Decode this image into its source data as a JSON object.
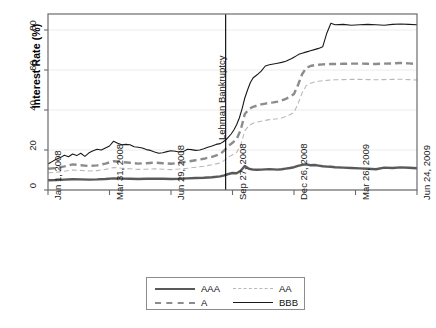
{
  "chart_data": {
    "type": "line",
    "title": "",
    "xlabel": "",
    "ylabel": "Interest Rate (%)",
    "ylim": [
      0,
      88
    ],
    "yticks": [
      0,
      20,
      40,
      60,
      80
    ],
    "ytick_labels": [
      "0",
      "20",
      "40",
      "60",
      "80"
    ],
    "xlim": [
      0,
      540
    ],
    "xticks": [
      0,
      90,
      180,
      270,
      360,
      450,
      540
    ],
    "xtick_labels": [
      "Jan 1, 2008",
      "Mar 31, 2008",
      "Jun 29, 2008",
      "Sep 27, 2008",
      "Dec 26, 2008",
      "Mar 26, 2009",
      "Jun 24, 2009"
    ],
    "grid": "horizontal",
    "legend_position": "below-center",
    "annotations": [
      {
        "text": "Lehman Bankruptcy",
        "x": 260,
        "orientation": "vertical",
        "line": "solid-black"
      }
    ],
    "series": [
      {
        "name": "AAA",
        "style": "solid",
        "width": "thick",
        "color": "#595959",
        "x": [
          0,
          12,
          24,
          36,
          48,
          60,
          72,
          84,
          96,
          108,
          120,
          132,
          144,
          156,
          168,
          180,
          192,
          204,
          216,
          228,
          240,
          252,
          258,
          264,
          270,
          276,
          282,
          288,
          294,
          300,
          306,
          312,
          318,
          324,
          330,
          336,
          342,
          348,
          354,
          360,
          366,
          372,
          378,
          384,
          390,
          396,
          402,
          408,
          414,
          420,
          432,
          444,
          456,
          468,
          480,
          492,
          504,
          516,
          528,
          540
        ],
        "y": [
          4.9,
          5.0,
          5.2,
          5.4,
          5.3,
          5.2,
          5.3,
          5.5,
          5.8,
          5.7,
          5.6,
          5.5,
          5.6,
          5.7,
          5.6,
          5.5,
          5.6,
          5.8,
          6.0,
          6.1,
          6.4,
          6.8,
          7.3,
          8.0,
          8.5,
          8.4,
          9.6,
          12.0,
          10.6,
          10.2,
          10.1,
          10.2,
          10.3,
          10.4,
          10.3,
          10.2,
          10.4,
          10.7,
          11.0,
          11.4,
          12.1,
          12.6,
          12.8,
          12.4,
          12.5,
          12.2,
          11.9,
          11.7,
          11.6,
          11.4,
          11.2,
          11.0,
          10.8,
          10.6,
          10.4,
          11.2,
          11.0,
          11.3,
          11.1,
          10.9
        ]
      },
      {
        "name": "AA",
        "style": "dashed",
        "width": "thin",
        "color": "#b8b8b8",
        "x": [
          0,
          12,
          24,
          36,
          48,
          60,
          72,
          84,
          96,
          108,
          120,
          132,
          144,
          156,
          168,
          180,
          192,
          204,
          216,
          228,
          240,
          252,
          258,
          264,
          270,
          276,
          282,
          288,
          294,
          300,
          306,
          312,
          318,
          324,
          330,
          336,
          342,
          348,
          354,
          360,
          366,
          372,
          378,
          384,
          390,
          396,
          402,
          408,
          414,
          420,
          432,
          444,
          456,
          468,
          480,
          492,
          504,
          516,
          528,
          540
        ],
        "y": [
          8.6,
          8.9,
          9.4,
          10.0,
          9.8,
          9.5,
          9.7,
          10.3,
          11.2,
          10.9,
          10.6,
          10.3,
          10.4,
          10.6,
          10.4,
          10.2,
          10.5,
          10.9,
          11.4,
          11.9,
          12.6,
          13.5,
          14.8,
          16.4,
          17.6,
          18.8,
          22.4,
          29.6,
          32.2,
          33.4,
          34.0,
          34.4,
          34.8,
          35.2,
          35.4,
          35.6,
          36.0,
          36.8,
          37.6,
          38.8,
          43.2,
          48.6,
          52.2,
          53.4,
          54.0,
          54.4,
          54.6,
          54.8,
          55.0,
          55.1,
          55.2,
          55.3,
          55.3,
          55.2,
          55.1,
          55.2,
          55.3,
          55.4,
          55.2,
          55.0
        ]
      },
      {
        "name": "A",
        "style": "dashed",
        "width": "thick",
        "color": "#8c8c8c",
        "x": [
          0,
          12,
          24,
          36,
          48,
          60,
          72,
          84,
          96,
          108,
          120,
          132,
          144,
          156,
          168,
          180,
          192,
          204,
          216,
          228,
          240,
          252,
          258,
          264,
          270,
          276,
          282,
          288,
          294,
          300,
          306,
          312,
          318,
          324,
          330,
          336,
          342,
          348,
          354,
          360,
          366,
          372,
          378,
          384,
          390,
          396,
          402,
          408,
          414,
          420,
          432,
          444,
          456,
          468,
          480,
          492,
          504,
          516,
          528,
          540
        ],
        "y": [
          10.6,
          11.0,
          11.8,
          12.8,
          12.4,
          12.0,
          12.3,
          13.2,
          14.4,
          14.0,
          13.6,
          13.2,
          13.4,
          13.7,
          13.4,
          13.1,
          13.6,
          14.2,
          14.9,
          15.6,
          16.6,
          18.0,
          19.8,
          22.0,
          23.6,
          25.4,
          30.0,
          38.0,
          40.4,
          41.6,
          42.2,
          42.8,
          43.2,
          43.6,
          43.8,
          44.2,
          44.8,
          45.6,
          46.6,
          48.0,
          52.6,
          58.0,
          61.0,
          62.0,
          62.4,
          62.6,
          62.8,
          62.9,
          63.0,
          63.0,
          63.1,
          63.2,
          63.2,
          63.1,
          63.0,
          63.2,
          63.3,
          63.5,
          63.3,
          63.0
        ]
      },
      {
        "name": "BBB",
        "style": "solid",
        "width": "thin",
        "color": "#1a1a1a",
        "x": [
          0,
          6,
          12,
          18,
          24,
          30,
          36,
          42,
          48,
          54,
          60,
          66,
          72,
          78,
          84,
          90,
          96,
          102,
          108,
          114,
          120,
          126,
          132,
          138,
          144,
          150,
          156,
          162,
          168,
          174,
          180,
          186,
          192,
          198,
          204,
          210,
          216,
          222,
          228,
          234,
          240,
          246,
          252,
          256,
          260,
          264,
          268,
          272,
          276,
          280,
          284,
          288,
          292,
          296,
          300,
          306,
          312,
          318,
          324,
          330,
          336,
          342,
          348,
          352,
          356,
          360,
          364,
          368,
          372,
          376,
          380,
          384,
          390,
          396,
          402,
          408,
          414,
          420,
          432,
          444,
          456,
          468,
          480,
          492,
          504,
          516,
          528,
          540
        ],
        "y": [
          13.0,
          14.2,
          15.4,
          16.2,
          17.4,
          16.6,
          18.0,
          17.2,
          18.4,
          16.8,
          18.6,
          19.6,
          20.4,
          20.0,
          21.0,
          22.0,
          24.4,
          23.4,
          22.6,
          22.8,
          22.6,
          21.6,
          21.4,
          21.0,
          20.2,
          19.8,
          19.0,
          18.4,
          18.6,
          19.2,
          19.6,
          19.4,
          19.0,
          19.2,
          20.4,
          20.2,
          19.8,
          20.0,
          20.6,
          21.4,
          22.0,
          22.8,
          23.2,
          24.0,
          25.0,
          26.4,
          28.0,
          30.0,
          32.6,
          36.0,
          40.6,
          46.0,
          50.0,
          53.6,
          56.0,
          57.6,
          59.4,
          62.0,
          62.6,
          63.0,
          63.4,
          63.8,
          64.4,
          65.0,
          65.6,
          66.4,
          67.2,
          68.0,
          68.4,
          68.8,
          69.2,
          69.6,
          70.2,
          70.8,
          71.6,
          78.4,
          83.4,
          82.6,
          82.8,
          82.4,
          82.6,
          82.8,
          82.6,
          82.4,
          82.8,
          83.0,
          82.8,
          82.6
        ]
      }
    ]
  },
  "legend": {
    "items": [
      {
        "label": "AAA",
        "style": "solid-thick-gray"
      },
      {
        "label": "AA",
        "style": "dashed-thin-lightgray"
      },
      {
        "label": "A",
        "style": "dashed-thick-gray"
      },
      {
        "label": "BBB",
        "style": "solid-thin-black"
      }
    ]
  }
}
